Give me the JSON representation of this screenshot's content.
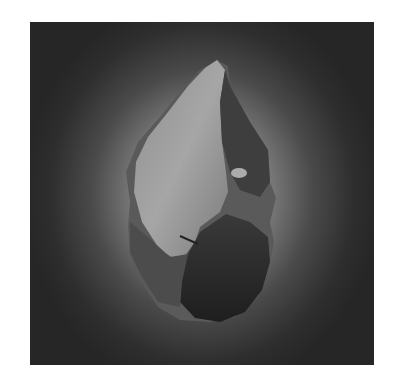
{
  "image": {
    "subject": "stone hand axe",
    "style": "grayscale photograph",
    "colors": {
      "page_background": "#ffffff",
      "background_center": "#bdbdbd",
      "background_edge": "#262626",
      "stone_light_face": "#9a9a9a",
      "stone_dark_face": "#2a2a2a",
      "stone_mid": "#5e5e5e"
    }
  }
}
